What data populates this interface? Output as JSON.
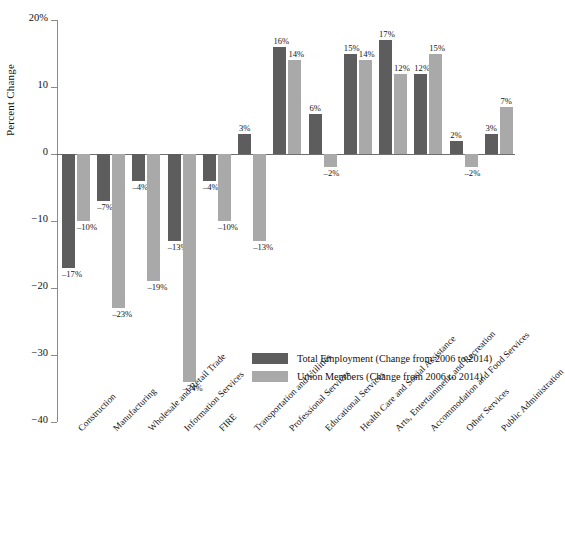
{
  "chart_data": {
    "type": "bar",
    "title": "",
    "xlabel": "",
    "ylabel": "Percent Change",
    "ylim": [
      -40,
      20
    ],
    "yticks": [
      20,
      10,
      0,
      -10,
      -20,
      -30,
      -40
    ],
    "ytick_labels": [
      "20%",
      "10",
      "0",
      "−10",
      "−20",
      "−30",
      "−40"
    ],
    "grid": false,
    "legend_position": "inside-lower-right",
    "categories": [
      "Construction",
      "Manufacturing",
      "Wholesale and Retail Trade",
      "Information Services",
      "FIRE",
      "Transportation and Utilities",
      "Professional Services",
      "Educational Services",
      "Health Care and Social Assistance",
      "Arts, Entertainment, and Recreation",
      "Accommodation and Food Services",
      "Other Services",
      "Public Administration"
    ],
    "series": [
      {
        "name": "Total Employment (Change from 2006 to 2014)",
        "color": "#5d5d5d",
        "values": [
          -17,
          -7,
          -4,
          -13,
          -4,
          3,
          16,
          6,
          15,
          17,
          12,
          2,
          3
        ],
        "labels": [
          "–17%",
          "–7%",
          "–4%",
          "–13%",
          "–4%",
          "3%",
          "16%",
          "6%",
          "15%",
          "17%",
          "12%",
          "2%",
          "3%"
        ]
      },
      {
        "name": "Union Members (Change from 2006 to 2014)",
        "color": "#a9a9a9",
        "values": [
          -10,
          -23,
          -19,
          -34,
          -10,
          -13,
          14,
          -2,
          14,
          12,
          15,
          -2,
          7
        ],
        "labels": [
          "–10%",
          "–23%",
          "–19%",
          "–34%",
          "–10%",
          "–13%",
          "14%",
          "–2%",
          "14%",
          "12%",
          "15%",
          "–2%",
          "7%"
        ]
      }
    ]
  },
  "legend": {
    "items": [
      {
        "label": "Total Employment (Change from 2006 to 2014)",
        "color": "#5d5d5d"
      },
      {
        "label": "Union Members (Change from 2006 to 2014)",
        "color": "#a9a9a9"
      }
    ]
  }
}
